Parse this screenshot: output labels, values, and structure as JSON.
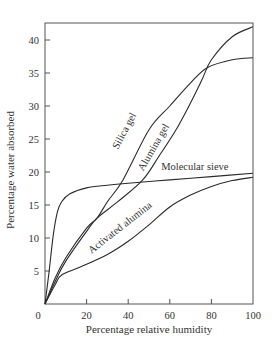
{
  "chart_data": {
    "type": "line",
    "title": "",
    "xlabel": "Percentage relative humidity",
    "ylabel": "Percentage water absorbed",
    "xlim": [
      0,
      100
    ],
    "ylim": [
      0,
      44
    ],
    "x_ticks": [
      0,
      20,
      40,
      60,
      80,
      100
    ],
    "y_ticks": [
      5,
      10,
      15,
      20,
      25,
      30,
      35,
      40
    ],
    "grid": false,
    "legend": "inline labels on curves",
    "series": [
      {
        "name": "Molecular sieve",
        "points": [
          [
            0,
            0
          ],
          [
            2,
            5
          ],
          [
            4,
            10.5
          ],
          [
            6,
            14
          ],
          [
            8,
            15.5
          ],
          [
            12,
            16.7
          ],
          [
            20,
            17.6
          ],
          [
            30,
            18
          ],
          [
            40,
            18.3
          ],
          [
            60,
            18.8
          ],
          [
            80,
            19.3
          ],
          [
            100,
            19.8
          ]
        ],
        "label": {
          "text": "Molecular sieve",
          "x": 72,
          "y": 20.3,
          "angle": 0
        }
      },
      {
        "name": "Silica gel",
        "points": [
          [
            0,
            0
          ],
          [
            5,
            4
          ],
          [
            10,
            7
          ],
          [
            20,
            11.5
          ],
          [
            25,
            13
          ],
          [
            30,
            15.5
          ],
          [
            37.5,
            18.8
          ],
          [
            50,
            26.4
          ],
          [
            60,
            30
          ],
          [
            70,
            33.5
          ],
          [
            78,
            35.8
          ],
          [
            90,
            37
          ],
          [
            100,
            37.3
          ]
        ],
        "label": {
          "text": "Silica gel",
          "x": 39.5,
          "y": 26,
          "angle": -62
        }
      },
      {
        "name": "Alumina gel",
        "points": [
          [
            0,
            0
          ],
          [
            5,
            3.5
          ],
          [
            10,
            6.5
          ],
          [
            20,
            11
          ],
          [
            25,
            13
          ],
          [
            35,
            15.5
          ],
          [
            47,
            18.8
          ],
          [
            55,
            22.5
          ],
          [
            63,
            26.4
          ],
          [
            70,
            30.5
          ],
          [
            75.5,
            34
          ],
          [
            80,
            37
          ],
          [
            90,
            40.5
          ],
          [
            100,
            42
          ]
        ],
        "label": {
          "text": "Alumina gel",
          "x": 53.5,
          "y": 23.5,
          "angle": -60
        }
      },
      {
        "name": "Activated alumina",
        "points": [
          [
            0,
            0
          ],
          [
            5,
            3
          ],
          [
            8,
            4.4
          ],
          [
            17,
            5.6
          ],
          [
            30,
            7.5
          ],
          [
            40,
            9.5
          ],
          [
            50,
            12
          ],
          [
            60,
            14.7
          ],
          [
            70,
            16.5
          ],
          [
            80,
            17.8
          ],
          [
            90,
            18.7
          ],
          [
            100,
            19.2
          ]
        ],
        "label": {
          "text": "Activated alumina",
          "x": 37,
          "y": 11.2,
          "angle": -38
        }
      }
    ]
  },
  "colors": {
    "curve": "#2a2a2a",
    "axis": "#555555",
    "text": "#333333",
    "background": "#ffffff"
  }
}
